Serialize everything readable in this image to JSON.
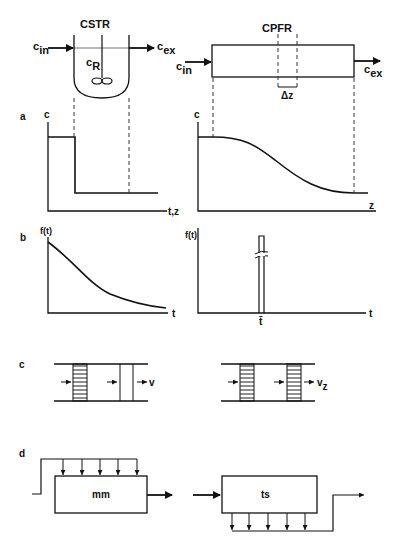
{
  "figure": {
    "top": {
      "cstr": {
        "title": "CSTR",
        "inlet": "c",
        "inlet_sub": "in",
        "outlet": "c",
        "outlet_sub": "ex",
        "interior": "c",
        "interior_sub": "R"
      },
      "cpfr": {
        "title": "CPFR",
        "inlet": "c",
        "inlet_sub": "in",
        "outlet": "c",
        "outlet_sub": "ex",
        "element": "Δz"
      }
    },
    "panel_a": {
      "label": "a",
      "left": {
        "ylabel": "c",
        "xlabel": "t,z"
      },
      "right": {
        "ylabel": "c",
        "xlabel": "z"
      }
    },
    "panel_b": {
      "label": "b",
      "left": {
        "ylabel": "f(t)",
        "xlabel": "t"
      },
      "right": {
        "ylabel": "f(t)",
        "xlabel": "t",
        "tick": "t̄"
      }
    },
    "panel_c": {
      "label": "c",
      "left": {
        "velocity": "v"
      },
      "right": {
        "velocity": "v",
        "velocity_sub": "z"
      }
    },
    "panel_d": {
      "label": "d",
      "left": {
        "box": "mm"
      },
      "right": {
        "box": "ts"
      }
    }
  }
}
